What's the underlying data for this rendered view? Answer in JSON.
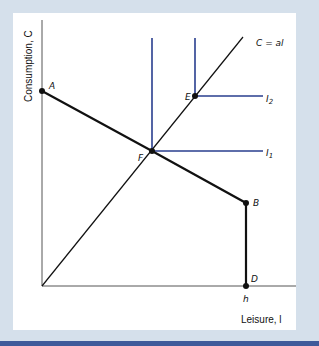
{
  "diagram": {
    "axes": {
      "y_label": "Consumption, C",
      "x_label": "Leisure, l",
      "x_tick_h": "h"
    },
    "points": {
      "A": "A",
      "B": "B",
      "D": "D",
      "E": "E",
      "F": "F"
    },
    "ray_label": "C = al",
    "indifference_curves": [
      "I2",
      "I1"
    ],
    "labels": {
      "I1_main": "I",
      "I1_sub": "1",
      "I2_main": "I",
      "I2_sub": "2"
    },
    "colors": {
      "background": "#d5e0eb",
      "panel": "#ffffff",
      "indifference": "#2a3f8f",
      "budget": "#111111",
      "bottom_stripe": "#3e5a9a"
    }
  }
}
